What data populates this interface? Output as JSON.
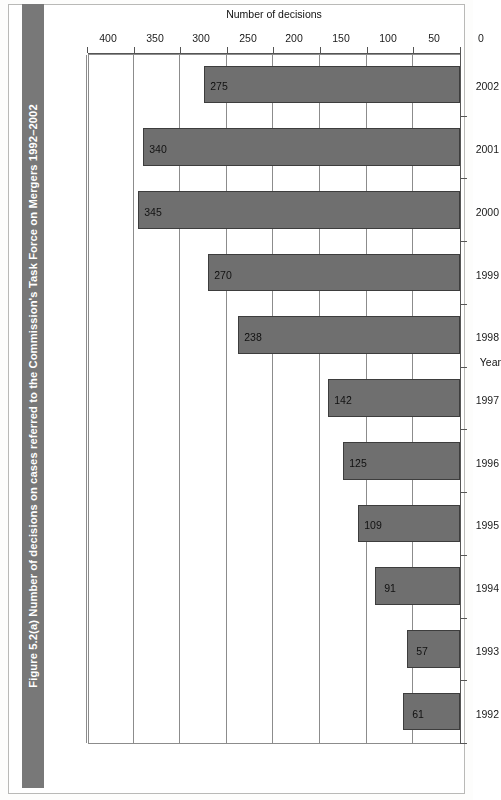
{
  "figure": {
    "caption": "Figure 5.2(a) Number of decisions on cases referred to the Commission's Task Force on Mergers 1992–2002",
    "band_color": "#787878"
  },
  "chart_data": {
    "type": "bar",
    "orientation": "horizontal",
    "title": "Figure 5.2(a) Number of decisions on cases referred to the Commission's Task Force on Mergers 1992–2002",
    "categories": [
      "1992",
      "1993",
      "1994",
      "1995",
      "1996",
      "1997",
      "1998",
      "1999",
      "2000",
      "2001",
      "2002"
    ],
    "values": [
      61,
      57,
      91,
      109,
      125,
      142,
      238,
      270,
      345,
      340,
      275
    ],
    "data_labels": [
      "61",
      "57",
      "91",
      "109",
      "125",
      "142",
      "238",
      "270",
      "345",
      "340",
      "275"
    ],
    "xlabel": "Number of decisions",
    "ylabel": "Year",
    "xlim": [
      0,
      400
    ],
    "xticks": [
      0,
      50,
      100,
      150,
      200,
      250,
      300,
      350,
      400
    ],
    "xtick_labels": [
      "0",
      "50",
      "100",
      "150",
      "200",
      "250",
      "300",
      "350",
      "400"
    ],
    "grid": true,
    "grid_axis": "value",
    "legend": false,
    "bar_color": "#6f6f6f",
    "bar_border_color": "#3d3d3d",
    "rotated_180": true
  }
}
